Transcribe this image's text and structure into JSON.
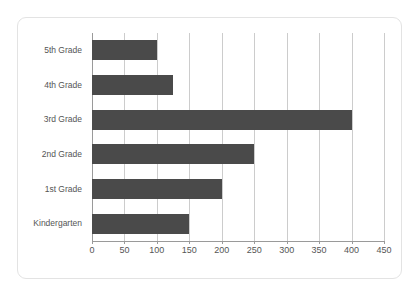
{
  "chart_data": {
    "type": "bar",
    "orientation": "horizontal",
    "title": "",
    "xlabel": "",
    "ylabel": "",
    "categories": [
      "Kindergarten",
      "1st Grade",
      "2nd Grade",
      "3rd Grade",
      "4th Grade",
      "5th Grade"
    ],
    "values": [
      150,
      200,
      250,
      400,
      125,
      100
    ],
    "xlim": [
      0,
      450
    ],
    "xticks": [
      0,
      50,
      100,
      150,
      200,
      250,
      300,
      350,
      400,
      450
    ],
    "xtick_labels": [
      "0",
      "50",
      "100",
      "150",
      "200",
      "250",
      "300",
      "350",
      "400",
      "450"
    ],
    "grid": "vertical",
    "legend": "none",
    "bar_color": "#4a4a4a",
    "gridline_color": "#cccccc",
    "axis_color": "#9a9a9a",
    "label_color": "#555555",
    "border_color": "#e3e3e3",
    "background_color": "#ffffff"
  }
}
